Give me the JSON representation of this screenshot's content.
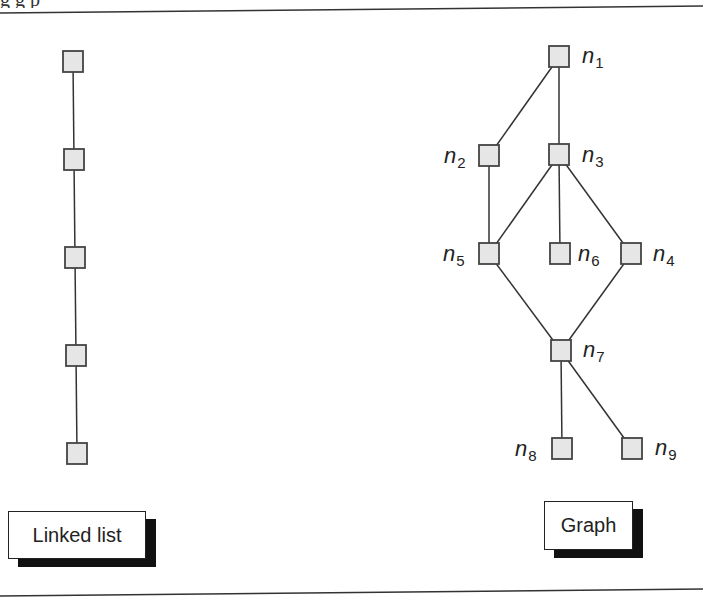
{
  "figure": {
    "caption_fragment": "g                                        g p",
    "colors": {
      "node_fill": "#e6e6e6",
      "node_stroke": "#444444",
      "edge": "#333333",
      "rule": "#333333"
    }
  },
  "linked_list": {
    "label": "Linked list",
    "nodes": [
      {
        "id": "ll1",
        "x": 73,
        "y": 62
      },
      {
        "id": "ll2",
        "x": 74,
        "y": 160
      },
      {
        "id": "ll3",
        "x": 75,
        "y": 258
      },
      {
        "id": "ll4",
        "x": 76,
        "y": 356
      },
      {
        "id": "ll5",
        "x": 77,
        "y": 454
      }
    ],
    "edges": [
      [
        "ll1",
        "ll2"
      ],
      [
        "ll2",
        "ll3"
      ],
      [
        "ll3",
        "ll4"
      ],
      [
        "ll4",
        "ll5"
      ]
    ]
  },
  "graph": {
    "label": "Graph",
    "nodes": [
      {
        "id": "n1",
        "name": "n",
        "sub": "1",
        "x": 559,
        "y": 57,
        "lx": 582,
        "ly": 63,
        "anchor": "start"
      },
      {
        "id": "n2",
        "name": "n",
        "sub": "2",
        "x": 489,
        "y": 156,
        "lx": 444,
        "ly": 163,
        "anchor": "start"
      },
      {
        "id": "n3",
        "name": "n",
        "sub": "3",
        "x": 559,
        "y": 155,
        "lx": 582,
        "ly": 162,
        "anchor": "start"
      },
      {
        "id": "n5",
        "name": "n",
        "sub": "5",
        "x": 489,
        "y": 254,
        "lx": 443,
        "ly": 261,
        "anchor": "start"
      },
      {
        "id": "n6",
        "name": "n",
        "sub": "6",
        "x": 560,
        "y": 254,
        "lx": 578,
        "ly": 261,
        "anchor": "start"
      },
      {
        "id": "n4",
        "name": "n",
        "sub": "4",
        "x": 631,
        "y": 254,
        "lx": 653,
        "ly": 261,
        "anchor": "start"
      },
      {
        "id": "n7",
        "name": "n",
        "sub": "7",
        "x": 561,
        "y": 351,
        "lx": 583,
        "ly": 357,
        "anchor": "start"
      },
      {
        "id": "n8",
        "name": "n",
        "sub": "8",
        "x": 562,
        "y": 449,
        "lx": 515,
        "ly": 456,
        "anchor": "start"
      },
      {
        "id": "n9",
        "name": "n",
        "sub": "9",
        "x": 632,
        "y": 449,
        "lx": 655,
        "ly": 455,
        "anchor": "start"
      }
    ],
    "edges": [
      [
        "n1",
        "n2"
      ],
      [
        "n1",
        "n3"
      ],
      [
        "n2",
        "n5"
      ],
      [
        "n3",
        "n5"
      ],
      [
        "n3",
        "n6"
      ],
      [
        "n3",
        "n4"
      ],
      [
        "n5",
        "n7"
      ],
      [
        "n4",
        "n7"
      ],
      [
        "n7",
        "n8"
      ],
      [
        "n7",
        "n9"
      ]
    ]
  }
}
